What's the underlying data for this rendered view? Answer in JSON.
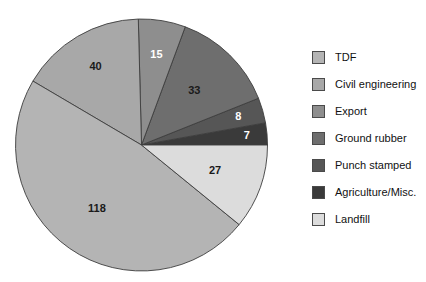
{
  "chart_data": {
    "type": "pie",
    "title": "",
    "categories": [
      "TDF",
      "Civil engineering",
      "Export",
      "Ground rubber",
      "Punch stamped",
      "Agriculture/Misc.",
      "Landfill"
    ],
    "values": [
      118,
      40,
      15,
      33,
      8,
      7,
      27
    ],
    "total": 248,
    "data_labels": [
      "118",
      "40",
      "15",
      "33",
      "8",
      "7",
      "27"
    ],
    "colors": [
      "#b4b4b4",
      "#a8a8a8",
      "#8e8e8e",
      "#6e6e6e",
      "#565656",
      "#3a3a3a",
      "#dcdcdc"
    ],
    "label_colors": [
      "dark",
      "dark",
      "light",
      "dark",
      "light",
      "light",
      "dark"
    ],
    "legend_position": "right",
    "grid": false,
    "start_angle_deg": 0,
    "direction": "counterclockwise"
  },
  "legend": {
    "items": [
      {
        "label": "TDF",
        "color": "#b4b4b4"
      },
      {
        "label": "Civil engineering",
        "color": "#a8a8a8"
      },
      {
        "label": "Export",
        "color": "#8e8e8e"
      },
      {
        "label": "Ground rubber",
        "color": "#6e6e6e"
      },
      {
        "label": "Punch stamped",
        "color": "#565656"
      },
      {
        "label": "Agriculture/Misc.",
        "color": "#3a3a3a"
      },
      {
        "label": "Landfill",
        "color": "#dcdcdc"
      }
    ]
  }
}
